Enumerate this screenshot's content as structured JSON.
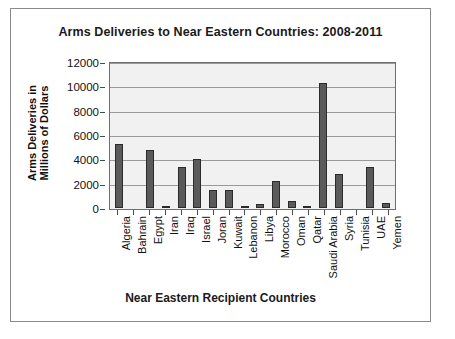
{
  "chart": {
    "title": "Arms Deliveries to Near Eastern Countries: 2008-2011",
    "xlabel": "Near Eastern Recipient Countries",
    "ylabel_line1": "Arms Deliveries in",
    "ylabel_line2": "Millions of Dollars",
    "bar_color": "#5a5a5a",
    "bar_edge_color": "#2b2b2b",
    "plot_background": "#f1f1f1",
    "gridline_color": "#9a9a9a"
  },
  "chart_data": {
    "type": "bar",
    "title": "Arms Deliveries to Near Eastern Countries: 2008-2011",
    "xlabel": "Near Eastern Recipient Countries",
    "ylabel": "Arms Deliveries in Millions of Dollars",
    "ylim": [
      0,
      12000
    ],
    "yticks": [
      0,
      2000,
      4000,
      6000,
      8000,
      10000,
      12000
    ],
    "ytick_labels": [
      "0",
      "2000",
      "4000",
      "6000",
      "8000",
      "10000",
      "12000"
    ],
    "grid": true,
    "legend": "none",
    "categories": [
      "Algeria",
      "Bahrain",
      "Egypt",
      "Iran",
      "Iraq",
      "Israel",
      "Joran",
      "Kuwait",
      "Lebanon",
      "Libya",
      "Morocco",
      "Oman",
      "Qatar",
      "Saudi Arabia",
      "Syria",
      "Tunisia",
      "UAE",
      "Yemen"
    ],
    "values": [
      5300,
      0,
      4800,
      200,
      3400,
      4000,
      1500,
      1500,
      100,
      300,
      2200,
      600,
      100,
      10300,
      2800,
      0,
      3400,
      400
    ]
  }
}
